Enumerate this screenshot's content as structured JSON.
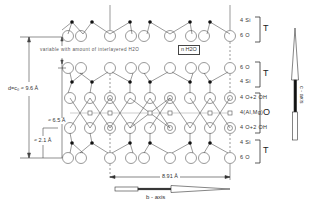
{
  "diagram": {
    "interlayer": {
      "note": "variable with amount of interlayered H2O",
      "water_label": "n H2O"
    },
    "layer_labels": [
      {
        "id": "top-si",
        "text": "4 Si"
      },
      {
        "id": "top-o",
        "text": "6 O"
      },
      {
        "id": "t2-o",
        "text": "6 O"
      },
      {
        "id": "t2-si",
        "text": "4 Si"
      },
      {
        "id": "oct-upper",
        "text": "4 O+2 OH"
      },
      {
        "id": "oct-cation",
        "text": "4(Al,Mg)"
      },
      {
        "id": "oct-lower",
        "text": "4 O+2 OH"
      },
      {
        "id": "t3-si",
        "text": "4 Si"
      },
      {
        "id": "t3-o",
        "text": "6 O"
      }
    ],
    "brackets": [
      {
        "id": "tetra-top",
        "text": "T"
      },
      {
        "id": "tetra-2",
        "text": "T"
      },
      {
        "id": "octa",
        "text": "O"
      },
      {
        "id": "tetra-bottom",
        "text": "T"
      }
    ],
    "dimensions": {
      "basal_spacing": "d=c₀ ≈ 9.6 Å",
      "layer_thickness": "≈ 6.5 Å",
      "tetra_height": "≈ 2.1 Å",
      "b_dimension": "8.91 Å"
    },
    "axes": {
      "c_axis": "c - axis",
      "b_axis": "b - axis"
    },
    "colors": {
      "line": "#555555",
      "atom_fill": "#ffffff",
      "si_fill": "#111111",
      "background": "#ffffff"
    }
  }
}
